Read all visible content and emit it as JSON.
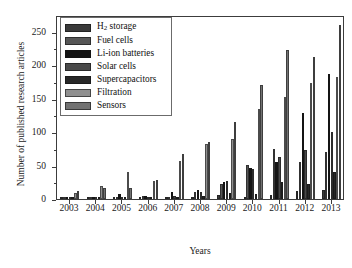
{
  "chart_data": {
    "type": "bar",
    "title": "",
    "xlabel": "Years",
    "ylabel": "Number of published research articles",
    "categories": [
      "2003",
      "2004",
      "2005",
      "2006",
      "2007",
      "2008",
      "2009",
      "2010",
      "2011",
      "2012",
      "2013"
    ],
    "ylim": [
      0,
      275
    ],
    "yticks": [
      0,
      50,
      100,
      150,
      200,
      250
    ],
    "ytick_labels": [
      "0",
      "50",
      "100",
      "150",
      "200",
      "250"
    ],
    "grid": false,
    "legend_position": "upper-left",
    "orientation": "vertical",
    "grouping": "grouped",
    "series": [
      {
        "name": "H2 storage",
        "label_html": "H<sub>2</sub> storage",
        "color": "#3a3a3a",
        "values": [
          2,
          1,
          3,
          1,
          2,
          2,
          6,
          2,
          6,
          12,
          14
        ]
      },
      {
        "name": "Fuel cells",
        "label_html": "Fuel cells",
        "color": "#565656",
        "values": [
          1,
          1,
          2,
          4,
          3,
          10,
          23,
          51,
          75,
          56,
          71
        ]
      },
      {
        "name": "Li-ion batteries",
        "label_html": "Li-ion batteries",
        "color": "#141414",
        "values": [
          1,
          1,
          8,
          5,
          10,
          14,
          25,
          47,
          55,
          128,
          187
        ]
      },
      {
        "name": "Solar cells",
        "label_html": "Solar cells",
        "color": "#4a4a4a",
        "values": [
          1,
          1,
          3,
          2,
          4,
          10,
          27,
          45,
          63,
          74,
          100
        ]
      },
      {
        "name": "Supercapacitors",
        "label_html": "Supercapacitors",
        "color": "#272727",
        "values": [
          2,
          2,
          2,
          2,
          3,
          5,
          9,
          8,
          26,
          23,
          40
        ]
      },
      {
        "name": "Filtration",
        "label_html": "Filtration",
        "color": "#8f8f8f",
        "values": [
          9,
          19,
          40,
          27,
          57,
          82,
          90,
          135,
          153,
          174,
          182
        ]
      },
      {
        "name": "Sensors",
        "label_html": "Sensors",
        "color": "#727272",
        "values": [
          12,
          17,
          16,
          29,
          67,
          85,
          115,
          171,
          223,
          212,
          260
        ]
      }
    ]
  }
}
